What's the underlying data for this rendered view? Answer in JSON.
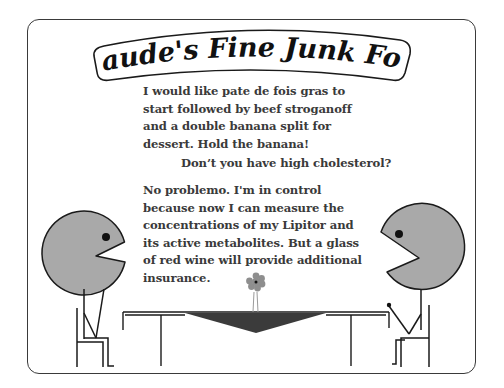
{
  "title": "Claude's Fine Junk Food",
  "dialogue": [
    {
      "speaker": "left-customer",
      "lines": [
        "I would like pate de fois gras to",
        "start followed by beef stroganoff",
        "and a double banana split for",
        "dessert. Hold the banana!"
      ]
    },
    {
      "speaker": "right-diner",
      "lines": [
        "Don’t you have high cholesterol?"
      ]
    },
    {
      "speaker": "left-customer",
      "lines": [
        "No problemo. I'm in control",
        "because now I can measure the",
        "concentrations of my Lipitor and",
        "its active metabolites. But a glass",
        "of red wine will provide additional",
        "insurance."
      ]
    }
  ],
  "colors": {
    "face": "#a9a9a9",
    "outline": "#1a1a1a",
    "text": "#3a3a3a",
    "tablecloth": "#3b3b3b",
    "flower": "#8e8e8e",
    "background": "#ffffff"
  }
}
